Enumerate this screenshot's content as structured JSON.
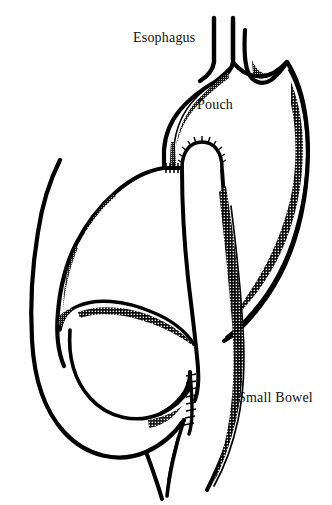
{
  "figure": {
    "background_color": "#ffffff",
    "ink_color": "#000000",
    "width": 332,
    "height": 505
  },
  "labels": {
    "esophagus": "Esophagus",
    "pouch": "Pouch",
    "small_bowel": "Small Bowel"
  },
  "label_positions": {
    "esophagus": {
      "x": 133,
      "y": 42
    },
    "pouch": {
      "x": 197,
      "y": 109
    },
    "small_bowel": {
      "x": 238,
      "y": 402
    }
  },
  "structures": [
    {
      "name": "esophagus",
      "description": "Vertical tube descending from top of image into the gastric pouch"
    },
    {
      "name": "gastric-pouch",
      "description": "Small proximal stomach pouch receiving the esophagus"
    },
    {
      "name": "staple-line-pouch",
      "description": "Serrated staple line dividing pouch from remnant stomach"
    },
    {
      "name": "remnant-stomach",
      "description": "Excluded distal stomach body on the right side"
    },
    {
      "name": "roux-limb",
      "description": "Small bowel limb ascending to join the gastric pouch"
    },
    {
      "name": "biliopancreatic-loop",
      "description": "C-shaped duodenal loop curving to the left"
    },
    {
      "name": "staple-line-jejunum",
      "description": "Serrated staple line at the lower jejunojejunal anastomosis"
    },
    {
      "name": "efferent-limb",
      "description": "Distal small bowel limb descending at bottom"
    }
  ]
}
